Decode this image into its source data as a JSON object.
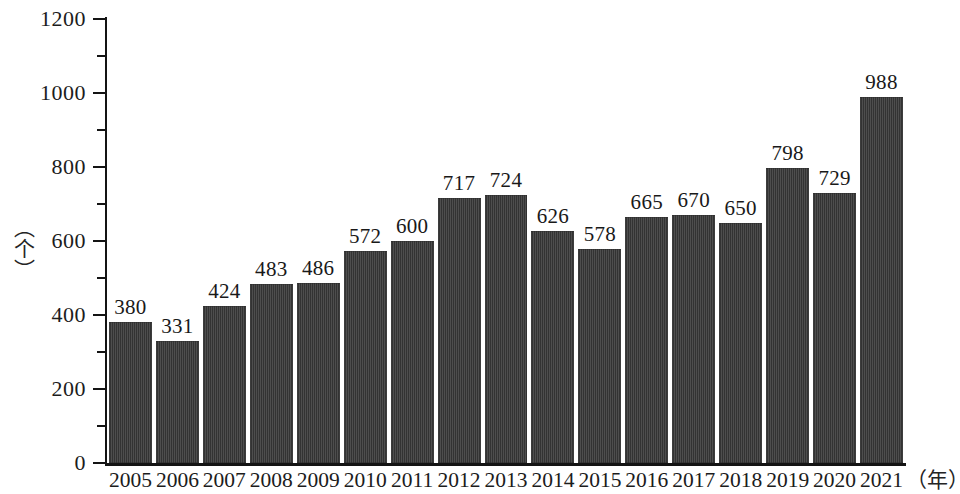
{
  "chart_data": {
    "type": "bar",
    "title": "",
    "subtitle": "",
    "xlabel": "（年）",
    "ylabel": "（个）",
    "categories": [
      "2005",
      "2006",
      "2007",
      "2008",
      "2009",
      "2010",
      "2011",
      "2012",
      "2013",
      "2014",
      "2015",
      "2016",
      "2017",
      "2018",
      "2019",
      "2020",
      "2021"
    ],
    "values": [
      380,
      331,
      424,
      483,
      486,
      572,
      600,
      717,
      724,
      626,
      578,
      665,
      670,
      650,
      798,
      729,
      988
    ],
    "value_labels": [
      "380",
      "331",
      "424",
      "483",
      "486",
      "572",
      "600",
      "717",
      "724",
      "626",
      "578",
      "665",
      "670",
      "650",
      "798",
      "729",
      "988"
    ],
    "ylim": [
      0,
      1200
    ],
    "y_ticks_major": [
      0,
      200,
      400,
      600,
      800,
      1000,
      1200
    ],
    "y_tick_labels": [
      "0",
      "200",
      "400",
      "600",
      "800",
      "1000",
      "1200"
    ],
    "y_ticks_minor": [
      100,
      300,
      500,
      700,
      900,
      1100
    ],
    "grid": false,
    "legend": null,
    "legend_position": "none",
    "series_color": "#3a3a3a",
    "axis_color": "#141414",
    "background_color": "#ffffff",
    "data_labels_shown": true
  }
}
